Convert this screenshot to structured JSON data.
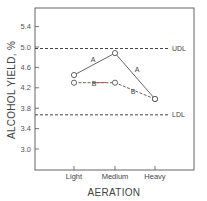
{
  "chart_data": {
    "type": "line",
    "title": "",
    "xlabel": "AERATION",
    "ylabel": "ALCOHOL YIELD, %",
    "categories": [
      "Light",
      "Medium",
      "Heavy"
    ],
    "yticks": [
      "5.4",
      "5.0",
      "4.6",
      "4.2",
      "3.8",
      "3.4",
      "3.0"
    ],
    "ylim": [
      2.7,
      5.7
    ],
    "grid": false,
    "series": [
      {
        "name": "A",
        "values": [
          4.45,
          4.88,
          3.98
        ],
        "style": "solid"
      },
      {
        "name": "B",
        "values": [
          4.3,
          4.3,
          3.98
        ],
        "style": "dashed"
      }
    ],
    "reference_lines": [
      {
        "name": "UDL",
        "value": 4.97,
        "style": "dashed"
      },
      {
        "name": "LDL",
        "value": 3.67,
        "style": "dashed"
      }
    ],
    "series_labels": [
      {
        "text": "A",
        "segment": "Light-Medium"
      },
      {
        "text": "A",
        "segment": "Medium-Heavy"
      },
      {
        "text": "B",
        "segment": "Light-Medium"
      },
      {
        "text": "B",
        "segment": "Medium-Heavy"
      }
    ]
  }
}
